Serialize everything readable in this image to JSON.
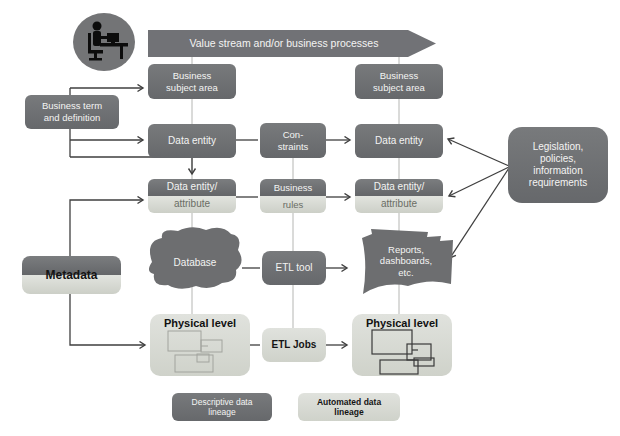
{
  "colors": {
    "box_dark": "#6d6e70",
    "box_light": "#d7d9d2",
    "connector": "#3f3f3f",
    "spine_line": "#b5b6b3",
    "text_on_dark": "#f4f4f3",
    "text_on_light": "#1d1d1b"
  },
  "banner": {
    "label": "Value stream and/or business processes"
  },
  "icons": {
    "actor": "person-at-desk-icon"
  },
  "nodes": {
    "business_term": {
      "label": "Business term\nand definition"
    },
    "metadata": {
      "label": "Metadata"
    },
    "left_subject_area": {
      "label": "Business\nsubject area"
    },
    "left_data_entity": {
      "label": "Data entity"
    },
    "left_data_entity_attribute": {
      "top": "Data entity/",
      "bottom": "attribute"
    },
    "database": {
      "label": "Database"
    },
    "left_physical_level": {
      "label": "Physical level"
    },
    "constraints": {
      "label": "Con-\nstraints"
    },
    "business_rules": {
      "top": "Business",
      "bottom": "rules"
    },
    "etl_tool": {
      "label": "ETL tool"
    },
    "etl_jobs": {
      "label": "ETL Jobs"
    },
    "right_subject_area": {
      "label": "Business\nsubject area"
    },
    "right_data_entity": {
      "label": "Data entity"
    },
    "right_data_entity_attribute": {
      "top": "Data entity/",
      "bottom": "attribute"
    },
    "reports": {
      "label": "Reports,\ndashboards,\netc."
    },
    "right_physical_level": {
      "label": "Physical level"
    },
    "legislation": {
      "label": "Legislation,\npolicies,\ninformation\nrequirements"
    }
  },
  "legend": {
    "descriptive": {
      "label": "Descriptive data\nlineage"
    },
    "automated": {
      "label": "Automated data\nlineage"
    }
  }
}
